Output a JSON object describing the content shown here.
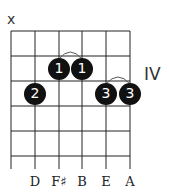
{
  "chord": {
    "muted_marker": "x",
    "position_label": "IV",
    "note_labels": [
      "D",
      "F♯",
      "B",
      "E",
      "A"
    ],
    "fingers": [
      {
        "finger": "1",
        "string": 3,
        "fret": 2
      },
      {
        "finger": "1",
        "string": 4,
        "fret": 2
      },
      {
        "finger": "2",
        "string": 2,
        "fret": 3
      },
      {
        "finger": "3",
        "string": 5,
        "fret": 3
      },
      {
        "finger": "3",
        "string": 6,
        "fret": 3
      }
    ],
    "frets_shown": 5,
    "strings": 6
  }
}
